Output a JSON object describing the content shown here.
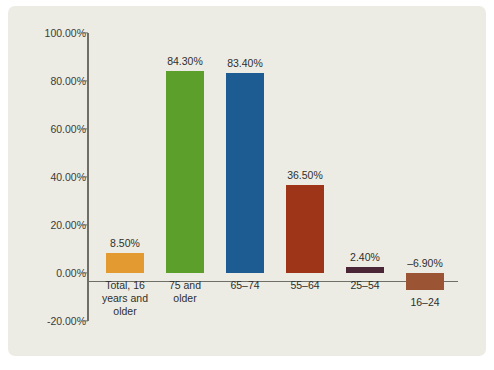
{
  "chart_title": "",
  "panel": {
    "background_color": "#ecece4",
    "axis_color": "#6f6f68",
    "text_color": "#2f2f2c"
  },
  "chart_data": {
    "type": "bar",
    "title": "",
    "xlabel": "",
    "ylabel": "",
    "ylim": [
      -20,
      100
    ],
    "grid": false,
    "legend": "none",
    "yticks": [
      100,
      80,
      60,
      40,
      20,
      0,
      -20
    ],
    "ytick_labels": [
      "100.00%",
      "80.00%",
      "60.00%",
      "40.00%",
      "20.00%",
      "0.00%",
      "-20.00%"
    ],
    "categories": [
      "Total, 16 years and older",
      "75 and older",
      "65–74",
      "55–64",
      "25–54",
      "16–24"
    ],
    "values": [
      8.5,
      84.3,
      83.4,
      36.5,
      2.4,
      -6.9
    ],
    "data_labels": [
      "8.50%",
      "84.30%",
      "83.40%",
      "36.50%",
      "2.40%",
      "–6.90%"
    ],
    "colors": [
      "#e39a30",
      "#5d9f2b",
      "#1c5c93",
      "#9e3518",
      "#4b2636",
      "#9b5534"
    ],
    "bars": [
      {
        "label_lines": [
          "Total, 16",
          "years and",
          "older"
        ],
        "value": 8.5,
        "value_label": "8.50%",
        "color": "#e39a30"
      },
      {
        "label_lines": [
          "75 and",
          "older"
        ],
        "value": 84.3,
        "value_label": "84.30%",
        "color": "#5d9f2b"
      },
      {
        "label_lines": [
          "65–74"
        ],
        "value": 83.4,
        "value_label": "83.40%",
        "color": "#1c5c93"
      },
      {
        "label_lines": [
          "55–64"
        ],
        "value": 36.5,
        "value_label": "36.50%",
        "color": "#9e3518"
      },
      {
        "label_lines": [
          "25–54"
        ],
        "value": 2.4,
        "value_label": "2.40%",
        "color": "#4b2636"
      },
      {
        "label_lines": [
          "16–24"
        ],
        "value": -6.9,
        "value_label": "–6.90%",
        "color": "#9b5534"
      }
    ]
  }
}
